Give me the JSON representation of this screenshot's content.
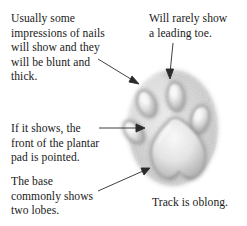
{
  "figure": {
    "background_color": "#ffffff",
    "ink_color": "#1a1a1a"
  },
  "annotations": {
    "nails": {
      "text": "Usually some\nimpressions of nails\nwill show and they\nwill be blunt and\nthick.",
      "points_to": "toe-pad-outer-left"
    },
    "leading_toe": {
      "text": "Will rarely show\na leading toe.",
      "points_to": "toe-pad-leading"
    },
    "plantar": {
      "text": "If it shows, the\nfront of the plantar\npad is pointed.",
      "points_to": "plantar-pad-front"
    },
    "lobes": {
      "text": "The base\ncommonly shows\ntwo lobes.",
      "points_to": "plantar-pad-base"
    },
    "oblong": {
      "text": "Track is oblong.",
      "points_to": "track-outline"
    }
  },
  "track": {
    "shape": "oblong",
    "toe_pad_count": 4,
    "plantar_pad_lobes": 2,
    "paw_fill": "#d9d9d9",
    "pad_fill": "#f2f2f2"
  }
}
